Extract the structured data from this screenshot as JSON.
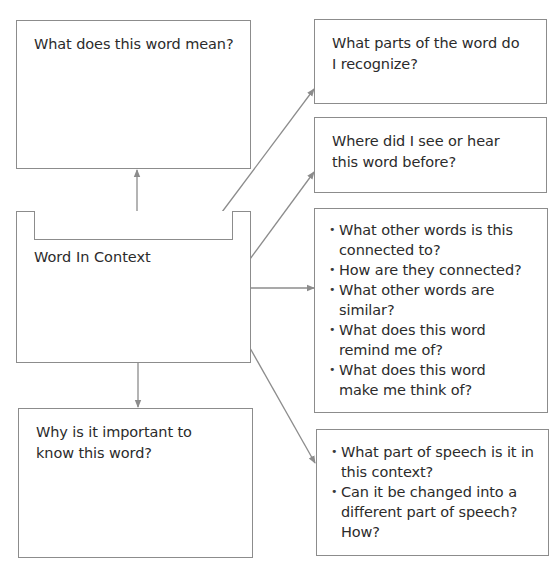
{
  "diagram": {
    "type": "word-map graphic organizer",
    "colors": {
      "border": "#8c8c8c",
      "text": "#2b2b2b",
      "arrow": "#8c8c8c",
      "background": "#ffffff"
    },
    "center": {
      "label": "Word In Context",
      "word_slot_value": ""
    },
    "top_left": {
      "label": "What does this word mean?"
    },
    "bottom_left": {
      "label": "Why is it important to know this word?"
    },
    "right": [
      {
        "label": "What parts of the word do I recognize?"
      },
      {
        "label": "Where did I see or hear this word before?"
      },
      {
        "bullets": [
          "What other words is this connected to?",
          "How are they connected?",
          "What other words are similar?",
          "What does this word remind me of?",
          "What does this word make me think of?"
        ]
      },
      {
        "bullets": [
          "What part of speech is it in this context?",
          "Can it be changed into a different part of speech? How?"
        ]
      }
    ],
    "arrows": [
      {
        "from": "center",
        "to": "top_left",
        "direction": "up"
      },
      {
        "from": "center",
        "to": "bottom_left",
        "direction": "down"
      },
      {
        "from": "center",
        "to": "right.0",
        "direction": "up-right"
      },
      {
        "from": "center",
        "to": "right.1",
        "direction": "up-right"
      },
      {
        "from": "center",
        "to": "right.2",
        "direction": "right"
      },
      {
        "from": "center",
        "to": "right.3",
        "direction": "down-right"
      }
    ]
  }
}
